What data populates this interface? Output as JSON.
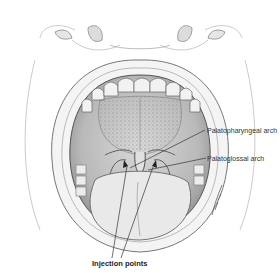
{
  "figure": {
    "labels": {
      "palatopharyngeal": "Palatopharyngeal arch",
      "palatoglossal": "Palatoglossal arch",
      "injection": "Injection points"
    },
    "colors": {
      "line": "#555555",
      "shade": "#9a9a9a",
      "dark": "#222222",
      "label_text": "#333333"
    }
  }
}
